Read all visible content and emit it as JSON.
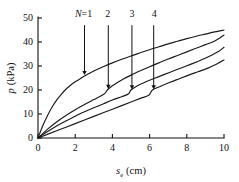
{
  "chart_data": {
    "type": "line",
    "title": "",
    "subtitle": "",
    "xlabel": "s_e (cm)",
    "xlabel_symbol": "s",
    "xlabel_subscript": "e",
    "xlabel_unit": "(cm)",
    "ylabel": "p (kPa)",
    "ylabel_symbol": "p",
    "ylabel_unit": "(kPa)",
    "xlim": [
      0,
      10
    ],
    "ylim": [
      0,
      50
    ],
    "xticks": [
      0,
      2,
      4,
      6,
      8,
      10
    ],
    "xticklabels": [
      "0",
      "2",
      "4",
      "6",
      "8",
      "10"
    ],
    "yticks": [
      0,
      10,
      20,
      30,
      40,
      50
    ],
    "yticklabels": [
      "0",
      "10",
      "20",
      "30",
      "40",
      "50"
    ],
    "grid": false,
    "legend": "none",
    "tick_direction": "in",
    "spines": [
      "left",
      "bottom"
    ],
    "series": [
      {
        "name": "N=1",
        "label": "N=1",
        "points": [
          [
            0.0,
            0.0
          ],
          [
            0.25,
            5.0
          ],
          [
            0.5,
            9.2
          ],
          [
            0.75,
            12.8
          ],
          [
            1.0,
            15.8
          ],
          [
            1.25,
            18.2
          ],
          [
            1.5,
            20.3
          ],
          [
            1.75,
            22.0
          ],
          [
            2.0,
            23.4
          ],
          [
            2.25,
            24.6
          ],
          [
            2.5,
            25.8
          ],
          [
            3.0,
            27.9
          ],
          [
            3.5,
            29.7
          ],
          [
            4.0,
            31.3
          ],
          [
            4.5,
            32.8
          ],
          [
            5.0,
            34.2
          ],
          [
            5.5,
            35.5
          ],
          [
            6.0,
            36.8
          ],
          [
            6.5,
            38.0
          ],
          [
            7.0,
            39.2
          ],
          [
            7.5,
            40.3
          ],
          [
            8.0,
            41.4
          ],
          [
            8.5,
            42.4
          ],
          [
            9.0,
            43.3
          ],
          [
            9.5,
            44.2
          ],
          [
            10.0,
            45.0
          ]
        ]
      },
      {
        "name": "N=2",
        "label": "2",
        "points": [
          [
            0.0,
            0.0
          ],
          [
            0.5,
            3.6
          ],
          [
            1.0,
            6.7
          ],
          [
            1.5,
            9.4
          ],
          [
            2.0,
            11.8
          ],
          [
            2.5,
            14.0
          ],
          [
            3.0,
            16.0
          ],
          [
            3.3,
            17.2
          ],
          [
            3.6,
            18.6
          ],
          [
            3.75,
            20.2
          ],
          [
            4.0,
            21.8
          ],
          [
            4.5,
            24.2
          ],
          [
            5.0,
            26.2
          ],
          [
            5.5,
            28.0
          ],
          [
            6.0,
            29.7
          ],
          [
            6.5,
            31.3
          ],
          [
            7.0,
            32.9
          ],
          [
            7.5,
            34.4
          ],
          [
            8.0,
            35.9
          ],
          [
            8.5,
            37.4
          ],
          [
            9.0,
            38.9
          ],
          [
            9.5,
            40.4
          ],
          [
            10.0,
            42.9
          ]
        ]
      },
      {
        "name": "N=3",
        "label": "3",
        "points": [
          [
            0.0,
            0.0
          ],
          [
            0.5,
            2.6
          ],
          [
            1.0,
            5.0
          ],
          [
            1.5,
            7.1
          ],
          [
            2.0,
            9.1
          ],
          [
            2.5,
            10.9
          ],
          [
            3.0,
            12.6
          ],
          [
            3.5,
            14.2
          ],
          [
            4.0,
            15.8
          ],
          [
            4.5,
            17.2
          ],
          [
            4.85,
            18.3
          ],
          [
            5.0,
            20.0
          ],
          [
            5.3,
            21.6
          ],
          [
            5.8,
            23.4
          ],
          [
            6.3,
            25.0
          ],
          [
            6.8,
            26.5
          ],
          [
            7.3,
            28.0
          ],
          [
            7.8,
            29.5
          ],
          [
            8.3,
            31.0
          ],
          [
            8.8,
            32.6
          ],
          [
            9.3,
            34.4
          ],
          [
            9.7,
            36.0
          ],
          [
            10.0,
            37.8
          ]
        ]
      },
      {
        "name": "N=4",
        "label": "4",
        "points": [
          [
            0.0,
            0.0
          ],
          [
            0.5,
            1.5
          ],
          [
            1.0,
            3.0
          ],
          [
            1.5,
            4.5
          ],
          [
            2.0,
            6.0
          ],
          [
            2.5,
            7.5
          ],
          [
            3.0,
            9.0
          ],
          [
            3.5,
            10.5
          ],
          [
            4.0,
            12.0
          ],
          [
            4.5,
            13.5
          ],
          [
            5.0,
            15.0
          ],
          [
            5.5,
            16.5
          ],
          [
            5.95,
            17.8
          ],
          [
            6.15,
            20.0
          ],
          [
            6.6,
            21.6
          ],
          [
            7.1,
            23.2
          ],
          [
            7.6,
            24.7
          ],
          [
            8.1,
            26.2
          ],
          [
            8.6,
            27.6
          ],
          [
            9.1,
            29.0
          ],
          [
            9.5,
            30.4
          ],
          [
            10.0,
            32.5
          ]
        ]
      }
    ],
    "annotations": [
      {
        "name": "annotation-N1",
        "text": "N=1",
        "label_x": 2.45,
        "label_y": 50.5,
        "arrow_x": 2.5,
        "arrow_from_y": 47.0,
        "arrow_to_y": 26.2
      },
      {
        "name": "annotation-N2",
        "text": "2",
        "label_x": 3.75,
        "label_y": 50.5,
        "arrow_x": 3.78,
        "arrow_from_y": 47.0,
        "arrow_to_y": 20.4
      },
      {
        "name": "annotation-N3",
        "text": "3",
        "label_x": 5.05,
        "label_y": 50.5,
        "arrow_x": 5.05,
        "arrow_from_y": 47.0,
        "arrow_to_y": 20.2
      },
      {
        "name": "annotation-N4",
        "text": "4",
        "label_x": 6.25,
        "label_y": 50.5,
        "arrow_x": 6.22,
        "arrow_from_y": 47.0,
        "arrow_to_y": 20.2
      }
    ],
    "colors": {
      "curve": "#1a1a1a",
      "axis": "#111111",
      "background": "#ffffff"
    }
  }
}
